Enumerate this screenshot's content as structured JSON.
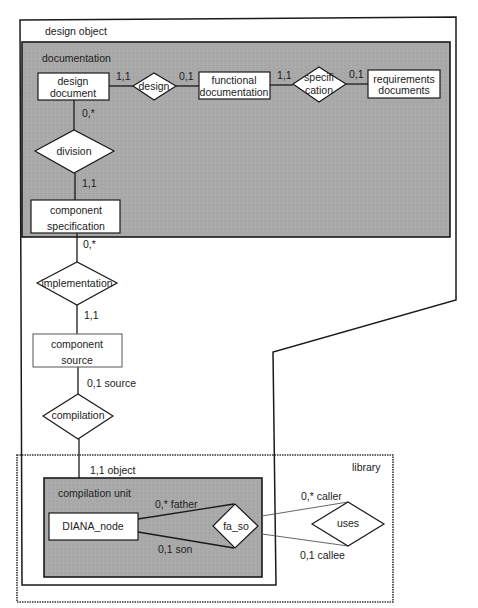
{
  "diagram": {
    "type": "entity-relationship",
    "groups": {
      "design_object": "design object",
      "documentation": "documentation",
      "library": "library",
      "compilation_unit": "compilation unit"
    },
    "entities": {
      "design_document": [
        "design",
        "document"
      ],
      "functional_documentation": [
        "functional",
        "documentation"
      ],
      "requirements_documents": [
        "requirements",
        "documents"
      ],
      "component_specification": [
        "component",
        "specification"
      ],
      "component_source": [
        "component",
        "source"
      ],
      "diana_node": "DIANA_node"
    },
    "relationships": {
      "design": "design",
      "specification": [
        "specifi",
        "cation"
      ],
      "division": "division",
      "implementation": "implementation",
      "compilation": "compilation",
      "fa_so": "fa_so",
      "uses": "uses"
    },
    "cardinalities": {
      "design_doc_to_design": "1,1",
      "design_to_functional": "0,1",
      "functional_to_spec": "1,1",
      "spec_to_requirements": "0,1",
      "design_doc_to_division": "0,*",
      "division_to_component_spec": "1,1",
      "component_spec_to_implementation": "0,*",
      "implementation_to_component_source": "1,1",
      "component_source_to_compilation": "0,1 source",
      "compilation_to_compilation_unit": "1,1 object",
      "father": "0,* father",
      "son": "0,1 son",
      "caller": "0,* caller",
      "callee": "0,1 callee"
    },
    "colors": {
      "group_fill": "#a8a8a8",
      "line": "#1a1a1a",
      "entity_fill": "#ffffff"
    }
  }
}
